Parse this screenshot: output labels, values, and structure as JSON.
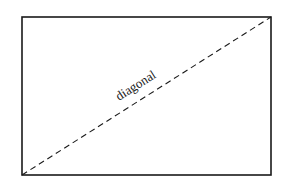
{
  "diagram": {
    "rectangle": {
      "x1": 22,
      "y1": 17,
      "x2": 271,
      "y2": 175,
      "stroke": "#1a1a1a"
    },
    "diagonal": {
      "from": "bottom-left",
      "to": "top-right",
      "style": "dashed",
      "stroke": "#1a1a1a"
    },
    "label": {
      "text": "diagonal",
      "x": 138,
      "y": 89,
      "rotation": -32.4
    }
  }
}
